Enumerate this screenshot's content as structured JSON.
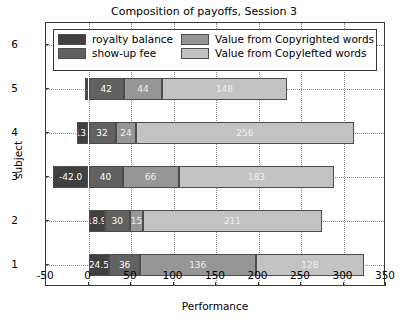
{
  "chart_data": {
    "type": "bar",
    "orientation": "horizontal",
    "stacked": true,
    "title": "Composition of payoffs, Session 3",
    "xlabel": "Performance",
    "ylabel": "subject",
    "xlim": [
      -50,
      350
    ],
    "xticks": [
      -50,
      0,
      50,
      100,
      150,
      200,
      250,
      300,
      350
    ],
    "xticklabels": [
      "-50",
      "0",
      "50",
      "100",
      "150",
      "200",
      "250",
      "300",
      "350"
    ],
    "categories": [
      "1",
      "2",
      "3",
      "4",
      "5",
      "6"
    ],
    "yticklabels": [
      "1",
      "2",
      "3",
      "4",
      "5",
      "6"
    ],
    "grid": true,
    "legend_position": "upper center",
    "series": [
      {
        "name": "royalty balance",
        "color": "#404040",
        "values": [
          24.5,
          18.9,
          -42.0,
          -13.3,
          -4.0,
          -2.1
        ],
        "labels": [
          "24.5",
          "18.9",
          "-42.0",
          "-13.3",
          "-4.0",
          "-2.1"
        ]
      },
      {
        "name": "show-up fee",
        "color": "#616161",
        "values": [
          36,
          30,
          40,
          32,
          42,
          58
        ],
        "labels": [
          "36",
          "30",
          "40",
          "32",
          "42",
          "58"
        ]
      },
      {
        "name": "Value from Copyrighted words",
        "color": "#969696",
        "values": [
          136,
          15,
          66,
          24,
          44,
          23
        ],
        "labels": [
          "136",
          "15",
          "66",
          "24",
          "44",
          "23"
        ]
      },
      {
        "name": "Value from Copylefted words",
        "color": "#c3c3c3",
        "values": [
          128,
          211,
          183,
          256,
          148,
          116
        ],
        "labels": [
          "128",
          "211",
          "183",
          "256",
          "148",
          "116"
        ]
      }
    ]
  }
}
